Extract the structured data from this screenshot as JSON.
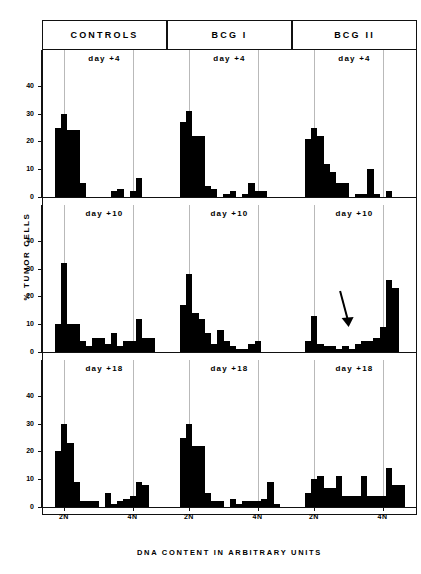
{
  "figure": {
    "ylabel": "% TUMOR CELLS",
    "xlabel": "DNA CONTENT IN ARBITRARY UNITS",
    "y_ticks": [
      "0",
      "10",
      "20",
      "30",
      "40"
    ],
    "x_ticks": [
      "2N",
      "4N"
    ],
    "columns": [
      "CONTROLS",
      "BCG I",
      "BCG II"
    ],
    "rows": [
      "day +4",
      "day +10",
      "day +18"
    ],
    "annotation": "arrow"
  },
  "chart_data": {
    "type": "bar",
    "title": "",
    "xlabel": "DNA CONTENT IN ARBITRARY UNITS",
    "ylabel": "% TUMOR CELLS",
    "ylim": [
      0,
      45
    ],
    "yticks": [
      0,
      10,
      20,
      30,
      40
    ],
    "grid": true,
    "xaxis_markers": {
      "2N": 3,
      "4N": 14
    },
    "bins": 20,
    "panels": [
      {
        "column": "CONTROLS",
        "row": "day +4",
        "label": "day +4",
        "values": [
          0,
          0,
          25,
          30,
          24,
          24,
          5,
          0,
          0,
          0,
          0,
          2,
          3,
          0,
          2,
          7,
          0,
          0,
          0,
          0
        ]
      },
      {
        "column": "BCG I",
        "row": "day +4",
        "label": "day +4",
        "values": [
          0,
          0,
          27,
          31,
          22,
          22,
          4,
          3,
          0,
          1,
          2,
          0,
          1,
          5,
          2,
          2,
          0,
          0,
          0,
          0
        ]
      },
      {
        "column": "BCG II",
        "row": "day +4",
        "label": "day +4",
        "values": [
          0,
          0,
          21,
          25,
          22,
          12,
          9,
          5,
          5,
          0,
          1,
          1,
          10,
          1,
          0,
          2,
          0,
          0,
          0,
          0
        ]
      },
      {
        "column": "CONTROLS",
        "row": "day +10",
        "label": "day +10",
        "values": [
          0,
          0,
          10,
          32,
          10,
          10,
          4,
          2,
          5,
          5,
          3,
          7,
          2,
          4,
          4,
          12,
          5,
          5,
          0,
          0
        ]
      },
      {
        "column": "BCG I",
        "row": "day +10",
        "label": "day +10",
        "values": [
          0,
          0,
          17,
          28,
          14,
          12,
          7,
          3,
          8,
          4,
          2,
          1,
          1,
          3,
          4,
          0,
          0,
          0,
          0,
          0
        ]
      },
      {
        "column": "BCG II",
        "row": "day +10",
        "label": "day +10",
        "values": [
          0,
          0,
          4,
          13,
          3,
          2,
          2,
          1,
          2,
          1,
          3,
          4,
          4,
          5,
          9,
          26,
          23,
          0,
          0,
          0
        ],
        "annotation": {
          "type": "arrow",
          "bin": 8,
          "y_from": 22,
          "y_to": 9
        }
      },
      {
        "column": "CONTROLS",
        "row": "day +18",
        "label": "day +18",
        "values": [
          0,
          0,
          20,
          30,
          23,
          9,
          2,
          2,
          2,
          0,
          5,
          1,
          2,
          3,
          4,
          9,
          8,
          0,
          0,
          0
        ]
      },
      {
        "column": "BCG I",
        "row": "day +18",
        "label": "day +18",
        "values": [
          0,
          0,
          25,
          30,
          22,
          22,
          5,
          2,
          2,
          0,
          3,
          1,
          2,
          2,
          2,
          3,
          9,
          1,
          0,
          0
        ]
      },
      {
        "column": "BCG II",
        "row": "day +18",
        "label": "day +18",
        "values": [
          0,
          0,
          5,
          10,
          11,
          7,
          7,
          11,
          4,
          4,
          4,
          11,
          4,
          4,
          4,
          14,
          8,
          8,
          0,
          0
        ]
      }
    ]
  }
}
